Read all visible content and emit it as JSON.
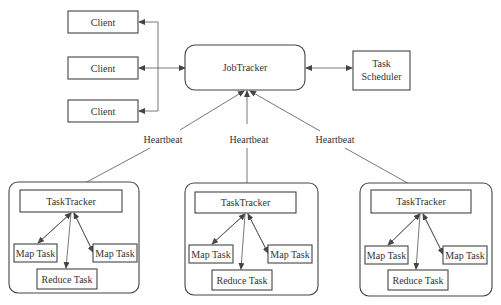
{
  "diagram": {
    "clients": [
      {
        "label": "Client"
      },
      {
        "label": "Client"
      },
      {
        "label": "Client"
      }
    ],
    "job_tracker": {
      "label": "JobTracker"
    },
    "task_scheduler": {
      "line1": "Task",
      "line2": "Scheduler"
    },
    "heartbeat_label": "Heartbeat",
    "heartbeats": [
      {
        "label": "Heartbeat"
      },
      {
        "label": "Heartbeat"
      },
      {
        "label": "Heartbeat"
      }
    ],
    "nodes": [
      {
        "task_tracker": "TaskTracker",
        "map_left": "Map Task",
        "map_right": "Map Task",
        "reduce": "Reduce Task"
      },
      {
        "task_tracker": "TaskTracker",
        "map_left": "Map Task",
        "map_right": "Map Task",
        "reduce": "Reduce Task"
      },
      {
        "task_tracker": "TaskTracker",
        "map_left": "Map Task",
        "map_right": "Map Task",
        "reduce": "Reduce Task"
      }
    ]
  }
}
